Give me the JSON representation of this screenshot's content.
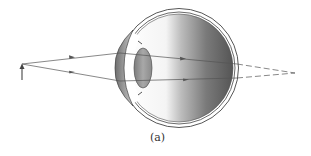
{
  "figure": {
    "caption": "(a)",
    "colors": {
      "ray": "#555555",
      "eye_outline": "#444444",
      "vitreous_dark": "#5a5a5a",
      "vitreous_light": "#ffffff",
      "lens": "#8a8a8a",
      "cornea": "#9a9a9a"
    },
    "elements": [
      {
        "name": "object-arrow",
        "x": 22,
        "y_base": 80,
        "y_tip": 64
      },
      {
        "name": "ray-upper",
        "path": [
          [
            22,
            64
          ],
          [
            120,
            53
          ],
          [
            183,
            60
          ],
          [
            237,
            64
          ]
        ],
        "virtual_extension": [
          [
            237,
            64
          ],
          [
            295,
            73
          ]
        ]
      },
      {
        "name": "ray-lower",
        "path": [
          [
            22,
            64
          ],
          [
            120,
            81
          ],
          [
            183,
            80
          ],
          [
            237,
            78
          ]
        ],
        "virtual_extension": [
          [
            237,
            78
          ],
          [
            295,
            73
          ]
        ]
      },
      {
        "name": "image-point-behind-retina",
        "x": 295,
        "y": 73
      }
    ]
  }
}
